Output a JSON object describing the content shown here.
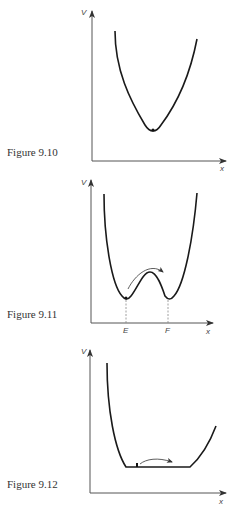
{
  "figures": [
    {
      "caption": "Figure 9.10",
      "y_label": "V",
      "x_label": "x",
      "description": "Single potential well with particle at the minimum"
    },
    {
      "caption": "Figure 9.11",
      "y_label": "V",
      "x_label": "x",
      "point_labels": [
        "E",
        "F"
      ],
      "description": "Double well potential with particle at E, arrow showing hop over barrier to F"
    },
    {
      "caption": "Figure 9.12",
      "y_label": "V",
      "x_label": "x",
      "description": "Flat-bottomed potential well with particle and arrow showing free movement along bottom"
    }
  ],
  "colors": {
    "curve": "#1a1a1a",
    "axis": "#555555",
    "dashed": "#888888",
    "background": "#ffffff"
  }
}
